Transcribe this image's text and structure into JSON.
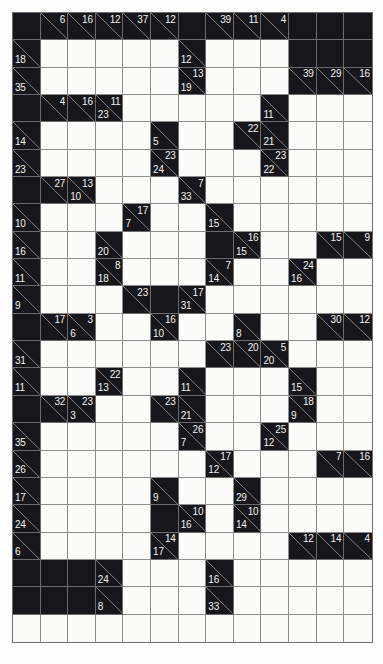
{
  "puzzle": {
    "type": "kakuro",
    "title": "Kakuro",
    "columns": 13,
    "rows": 23,
    "colors": {
      "block": "#17161a",
      "open": "#fbfbfa",
      "grid_line": "#8d8d8d",
      "clue_text": "#f2f2f0",
      "page_background": "#ffffff"
    },
    "legend": {
      "block_cell": "block-cell",
      "open_cell": "open-cell",
      "clue_cell": "clue-cell",
      "across_clue_position": "upper-right",
      "down_clue_position": "lower-left"
    },
    "grid": [
      [
        {
          "t": "b"
        },
        {
          "t": "c",
          "a": "6"
        },
        {
          "t": "c",
          "a": "16"
        },
        {
          "t": "c",
          "a": "12"
        },
        {
          "t": "c",
          "a": "37"
        },
        {
          "t": "c",
          "a": "12"
        },
        {
          "t": "b"
        },
        {
          "t": "c",
          "a": "39"
        },
        {
          "t": "c",
          "a": "11"
        },
        {
          "t": "c",
          "a": "4"
        },
        {
          "t": "b"
        },
        {
          "t": "b"
        },
        {
          "t": "b"
        }
      ],
      [
        {
          "t": "c",
          "d": "18"
        },
        {
          "t": "o"
        },
        {
          "t": "o"
        },
        {
          "t": "o"
        },
        {
          "t": "o"
        },
        {
          "t": "o"
        },
        {
          "t": "c",
          "d": "12"
        },
        {
          "t": "o"
        },
        {
          "t": "o"
        },
        {
          "t": "o"
        },
        {
          "t": "b"
        },
        {
          "t": "b"
        },
        {
          "t": "b"
        }
      ],
      [
        {
          "t": "c",
          "d": "35"
        },
        {
          "t": "o"
        },
        {
          "t": "o"
        },
        {
          "t": "o"
        },
        {
          "t": "o"
        },
        {
          "t": "o"
        },
        {
          "t": "c",
          "a": "13",
          "d": "19"
        },
        {
          "t": "o"
        },
        {
          "t": "o"
        },
        {
          "t": "o"
        },
        {
          "t": "c",
          "a": "39"
        },
        {
          "t": "c",
          "a": "29"
        },
        {
          "t": "c",
          "a": "16"
        }
      ],
      [
        {
          "t": "b"
        },
        {
          "t": "c",
          "a": "4"
        },
        {
          "t": "c",
          "a": "16"
        },
        {
          "t": "c",
          "a": "11",
          "d": "23"
        },
        {
          "t": "o"
        },
        {
          "t": "o"
        },
        {
          "t": "o"
        },
        {
          "t": "o"
        },
        {
          "t": "o"
        },
        {
          "t": "c",
          "d": "11"
        },
        {
          "t": "o"
        },
        {
          "t": "o"
        },
        {
          "t": "o"
        }
      ],
      [
        {
          "t": "c",
          "d": "14"
        },
        {
          "t": "o"
        },
        {
          "t": "o"
        },
        {
          "t": "o"
        },
        {
          "t": "o"
        },
        {
          "t": "c",
          "d": "5"
        },
        {
          "t": "o"
        },
        {
          "t": "o"
        },
        {
          "t": "c",
          "a": "22"
        },
        {
          "t": "c",
          "d": "21"
        },
        {
          "t": "o"
        },
        {
          "t": "o"
        },
        {
          "t": "o"
        }
      ],
      [
        {
          "t": "c",
          "d": "23"
        },
        {
          "t": "o"
        },
        {
          "t": "o"
        },
        {
          "t": "o"
        },
        {
          "t": "o"
        },
        {
          "t": "c",
          "a": "23",
          "d": "24"
        },
        {
          "t": "o"
        },
        {
          "t": "o"
        },
        {
          "t": "o"
        },
        {
          "t": "c",
          "a": "23",
          "d": "22"
        },
        {
          "t": "o"
        },
        {
          "t": "o"
        },
        {
          "t": "o"
        }
      ],
      [
        {
          "t": "b"
        },
        {
          "t": "c",
          "a": "27"
        },
        {
          "t": "c",
          "a": "13",
          "d": "10"
        },
        {
          "t": "o"
        },
        {
          "t": "o"
        },
        {
          "t": "o"
        },
        {
          "t": "c",
          "a": "7",
          "d": "33"
        },
        {
          "t": "o"
        },
        {
          "t": "o"
        },
        {
          "t": "o"
        },
        {
          "t": "o"
        },
        {
          "t": "o"
        },
        {
          "t": "o"
        }
      ],
      [
        {
          "t": "c",
          "d": "10"
        },
        {
          "t": "o"
        },
        {
          "t": "o"
        },
        {
          "t": "o"
        },
        {
          "t": "c",
          "a": "17",
          "d": "7"
        },
        {
          "t": "o"
        },
        {
          "t": "o"
        },
        {
          "t": "c",
          "d": "15"
        },
        {
          "t": "o"
        },
        {
          "t": "o"
        },
        {
          "t": "o"
        },
        {
          "t": "o"
        },
        {
          "t": "o"
        }
      ],
      [
        {
          "t": "c",
          "d": "16"
        },
        {
          "t": "o"
        },
        {
          "t": "o"
        },
        {
          "t": "c",
          "d": "20"
        },
        {
          "t": "o"
        },
        {
          "t": "o"
        },
        {
          "t": "o"
        },
        {
          "t": "b"
        },
        {
          "t": "c",
          "a": "16",
          "d": "15"
        },
        {
          "t": "o"
        },
        {
          "t": "o"
        },
        {
          "t": "c",
          "a": "15"
        },
        {
          "t": "c",
          "a": "9"
        }
      ],
      [
        {
          "t": "c",
          "d": "11"
        },
        {
          "t": "o"
        },
        {
          "t": "o"
        },
        {
          "t": "c",
          "a": "8",
          "d": "18"
        },
        {
          "t": "o"
        },
        {
          "t": "o"
        },
        {
          "t": "o"
        },
        {
          "t": "c",
          "a": "7",
          "d": "14"
        },
        {
          "t": "o"
        },
        {
          "t": "o"
        },
        {
          "t": "c",
          "a": "24",
          "d": "16"
        },
        {
          "t": "o"
        },
        {
          "t": "o"
        }
      ],
      [
        {
          "t": "c",
          "d": "9"
        },
        {
          "t": "o"
        },
        {
          "t": "o"
        },
        {
          "t": "o"
        },
        {
          "t": "c",
          "a": "23"
        },
        {
          "t": "b"
        },
        {
          "t": "c",
          "a": "17",
          "d": "31"
        },
        {
          "t": "o"
        },
        {
          "t": "o"
        },
        {
          "t": "o"
        },
        {
          "t": "o"
        },
        {
          "t": "o"
        },
        {
          "t": "o"
        }
      ],
      [
        {
          "t": "b"
        },
        {
          "t": "c",
          "a": "17"
        },
        {
          "t": "c",
          "a": "3",
          "d": "6"
        },
        {
          "t": "o"
        },
        {
          "t": "o"
        },
        {
          "t": "c",
          "a": "16",
          "d": "10"
        },
        {
          "t": "o"
        },
        {
          "t": "o"
        },
        {
          "t": "c",
          "d": "8"
        },
        {
          "t": "o"
        },
        {
          "t": "o"
        },
        {
          "t": "c",
          "a": "30"
        },
        {
          "t": "c",
          "a": "12"
        }
      ],
      [
        {
          "t": "c",
          "d": "31"
        },
        {
          "t": "o"
        },
        {
          "t": "o"
        },
        {
          "t": "o"
        },
        {
          "t": "o"
        },
        {
          "t": "o"
        },
        {
          "t": "o"
        },
        {
          "t": "c",
          "a": "23"
        },
        {
          "t": "c",
          "a": "20"
        },
        {
          "t": "c",
          "a": "5",
          "d": "20"
        },
        {
          "t": "o"
        },
        {
          "t": "o"
        },
        {
          "t": "o"
        }
      ],
      [
        {
          "t": "c",
          "d": "11"
        },
        {
          "t": "o"
        },
        {
          "t": "o"
        },
        {
          "t": "c",
          "a": "22",
          "d": "13"
        },
        {
          "t": "o"
        },
        {
          "t": "o"
        },
        {
          "t": "c",
          "d": "11"
        },
        {
          "t": "o"
        },
        {
          "t": "o"
        },
        {
          "t": "o"
        },
        {
          "t": "c",
          "d": "15"
        },
        {
          "t": "o"
        },
        {
          "t": "o"
        }
      ],
      [
        {
          "t": "b"
        },
        {
          "t": "c",
          "a": "32"
        },
        {
          "t": "c",
          "a": "23",
          "d": "3"
        },
        {
          "t": "o"
        },
        {
          "t": "o"
        },
        {
          "t": "c",
          "a": "23"
        },
        {
          "t": "c",
          "d": "21"
        },
        {
          "t": "o"
        },
        {
          "t": "o"
        },
        {
          "t": "o"
        },
        {
          "t": "c",
          "a": "18",
          "d": "9"
        },
        {
          "t": "o"
        },
        {
          "t": "o"
        }
      ],
      [
        {
          "t": "c",
          "d": "35"
        },
        {
          "t": "o"
        },
        {
          "t": "o"
        },
        {
          "t": "o"
        },
        {
          "t": "o"
        },
        {
          "t": "o"
        },
        {
          "t": "c",
          "a": "26",
          "d": "7"
        },
        {
          "t": "o"
        },
        {
          "t": "o"
        },
        {
          "t": "c",
          "a": "25",
          "d": "12"
        },
        {
          "t": "o"
        },
        {
          "t": "o"
        },
        {
          "t": "o"
        }
      ],
      [
        {
          "t": "c",
          "d": "26"
        },
        {
          "t": "o"
        },
        {
          "t": "o"
        },
        {
          "t": "o"
        },
        {
          "t": "o"
        },
        {
          "t": "o"
        },
        {
          "t": "o"
        },
        {
          "t": "c",
          "a": "17",
          "d": "12"
        },
        {
          "t": "o"
        },
        {
          "t": "o"
        },
        {
          "t": "o"
        },
        {
          "t": "c",
          "a": "7"
        },
        {
          "t": "c",
          "a": "16"
        }
      ],
      [
        {
          "t": "c",
          "d": "17"
        },
        {
          "t": "o"
        },
        {
          "t": "o"
        },
        {
          "t": "o"
        },
        {
          "t": "o"
        },
        {
          "t": "c",
          "d": "9"
        },
        {
          "t": "o"
        },
        {
          "t": "o"
        },
        {
          "t": "c",
          "d": "29"
        },
        {
          "t": "o"
        },
        {
          "t": "o"
        },
        {
          "t": "o"
        },
        {
          "t": "o"
        }
      ],
      [
        {
          "t": "c",
          "d": "24"
        },
        {
          "t": "o"
        },
        {
          "t": "o"
        },
        {
          "t": "o"
        },
        {
          "t": "o"
        },
        {
          "t": "b"
        },
        {
          "t": "c",
          "a": "10",
          "d": "16"
        },
        {
          "t": "o"
        },
        {
          "t": "c",
          "a": "10",
          "d": "14"
        },
        {
          "t": "o"
        },
        {
          "t": "o"
        },
        {
          "t": "o"
        },
        {
          "t": "o"
        }
      ],
      [
        {
          "t": "c",
          "d": "6"
        },
        {
          "t": "o"
        },
        {
          "t": "o"
        },
        {
          "t": "o"
        },
        {
          "t": "o"
        },
        {
          "t": "c",
          "a": "14",
          "d": "17"
        },
        {
          "t": "o"
        },
        {
          "t": "o"
        },
        {
          "t": "o"
        },
        {
          "t": "o"
        },
        {
          "t": "c",
          "a": "12"
        },
        {
          "t": "c",
          "a": "14"
        },
        {
          "t": "c",
          "a": "4"
        }
      ],
      [
        {
          "t": "b"
        },
        {
          "t": "b"
        },
        {
          "t": "b"
        },
        {
          "t": "c",
          "d": "24"
        },
        {
          "t": "o"
        },
        {
          "t": "o"
        },
        {
          "t": "o"
        },
        {
          "t": "c",
          "d": "16"
        },
        {
          "t": "o"
        },
        {
          "t": "o"
        },
        {
          "t": "o"
        },
        {
          "t": "o"
        },
        {
          "t": "o"
        }
      ],
      [
        {
          "t": "b"
        },
        {
          "t": "b"
        },
        {
          "t": "b"
        },
        {
          "t": "c",
          "d": "8"
        },
        {
          "t": "o"
        },
        {
          "t": "o"
        },
        {
          "t": "o"
        },
        {
          "t": "c",
          "d": "33"
        },
        {
          "t": "o"
        },
        {
          "t": "o"
        },
        {
          "t": "o"
        },
        {
          "t": "o"
        },
        {
          "t": "o"
        }
      ],
      [
        {
          "t": "o"
        },
        {
          "t": "o"
        },
        {
          "t": "o"
        },
        {
          "t": "o"
        },
        {
          "t": "o"
        },
        {
          "t": "o"
        },
        {
          "t": "o"
        },
        {
          "t": "o"
        },
        {
          "t": "o"
        },
        {
          "t": "o"
        },
        {
          "t": "o"
        },
        {
          "t": "o"
        },
        {
          "t": "o"
        }
      ]
    ]
  }
}
